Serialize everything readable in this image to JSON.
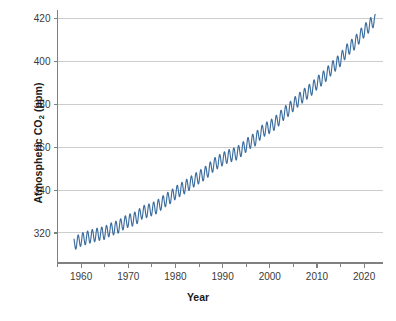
{
  "chart_data": {
    "type": "line",
    "title": "Atmospheric CO2 concentration (Keeling Curve)",
    "xlabel": "Year",
    "ylabel_text": "Atmospheric CO",
    "ylabel_sub": "2",
    "ylabel_unit": " (ppm)",
    "ylabel_full": "Atmospheric CO2 (ppm)",
    "xlim": [
      1955,
      2024
    ],
    "ylim": [
      306,
      423
    ],
    "xticks": [
      1960,
      1970,
      1980,
      1990,
      2000,
      2010,
      2020
    ],
    "xticklabels": [
      "1960",
      "1970",
      "1980",
      "1990",
      "2000",
      "2010",
      "2020"
    ],
    "xminorticks": [
      1955,
      1965,
      1975,
      1985,
      1995,
      2005,
      2015
    ],
    "yticks": [
      320,
      340,
      360,
      380,
      400,
      420
    ],
    "yticklabels": [
      "320",
      "340",
      "360",
      "380",
      "400",
      "420"
    ],
    "grid": "horizontal",
    "legend": "none",
    "series_name": "Monthly mean atmospheric CO2 (Mauna Loa)",
    "line_color": "#3c6d9e",
    "grid_color": "#cdcdcd",
    "axis_color": "#808080",
    "tick_label_color": "#3a3a3a",
    "seasonal_amplitude_ppm": 3.0,
    "x": [
      1958.5,
      1959,
      1960,
      1961,
      1962,
      1963,
      1964,
      1965,
      1966,
      1967,
      1968,
      1969,
      1970,
      1971,
      1972,
      1973,
      1974,
      1975,
      1976,
      1977,
      1978,
      1979,
      1980,
      1981,
      1982,
      1983,
      1984,
      1985,
      1986,
      1987,
      1988,
      1989,
      1990,
      1991,
      1992,
      1993,
      1994,
      1995,
      1996,
      1997,
      1998,
      1999,
      2000,
      2001,
      2002,
      2003,
      2004,
      2005,
      2006,
      2007,
      2008,
      2009,
      2010,
      2011,
      2012,
      2013,
      2014,
      2015,
      2016,
      2017,
      2018,
      2019,
      2020,
      2021,
      2022
    ],
    "annual_mean_ppm": [
      315.0,
      315.6,
      316.9,
      317.6,
      318.4,
      319.0,
      319.6,
      320.0,
      321.4,
      322.2,
      323.0,
      324.6,
      325.7,
      326.3,
      327.5,
      329.7,
      330.2,
      331.1,
      332.0,
      333.8,
      335.4,
      336.8,
      338.7,
      340.1,
      341.4,
      343.0,
      344.6,
      346.0,
      347.4,
      349.2,
      351.6,
      353.1,
      354.4,
      355.6,
      356.4,
      357.1,
      358.8,
      360.8,
      362.6,
      363.7,
      366.6,
      368.3,
      369.5,
      371.0,
      373.2,
      375.8,
      377.5,
      379.8,
      381.9,
      383.8,
      385.6,
      387.4,
      389.9,
      391.7,
      393.9,
      396.5,
      398.7,
      400.8,
      404.2,
      406.6,
      408.5,
      411.4,
      414.2,
      416.4,
      419.0
    ],
    "source_note": "Mauna Loa Observatory monthly mean with seasonal oscillation"
  },
  "axes": {
    "x_axis_name": "year-axis",
    "y_axis_name": "co2-axis"
  }
}
